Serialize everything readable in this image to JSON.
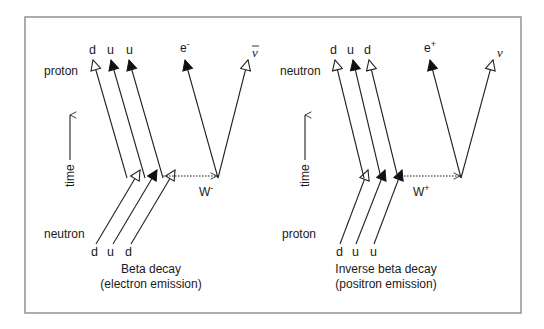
{
  "colors": {
    "frame": "#8a8a8a",
    "ink": "#222222",
    "background": "#ffffff"
  },
  "left_panel": {
    "time_axis_label": "time",
    "top_particle": "proton",
    "bottom_particle": "neutron",
    "top_quarks": [
      "d",
      "u",
      "u"
    ],
    "bottom_quarks": [
      "d",
      "u",
      "d"
    ],
    "lepton": "e",
    "lepton_charge": "-",
    "neutrino": "ν",
    "boson": "W",
    "boson_charge": "-",
    "caption_line1": "Beta decay",
    "caption_line2": "(electron emission)"
  },
  "right_panel": {
    "time_axis_label": "time",
    "top_particle": "neutron",
    "bottom_particle": "proton",
    "top_quarks": [
      "d",
      "u",
      "d"
    ],
    "bottom_quarks": [
      "d",
      "u",
      "u"
    ],
    "lepton": "e",
    "lepton_charge": "+",
    "neutrino": "ν",
    "boson": "W",
    "boson_charge": "+",
    "caption_line1": "Inverse beta decay",
    "caption_line2": "(positron emission)"
  }
}
